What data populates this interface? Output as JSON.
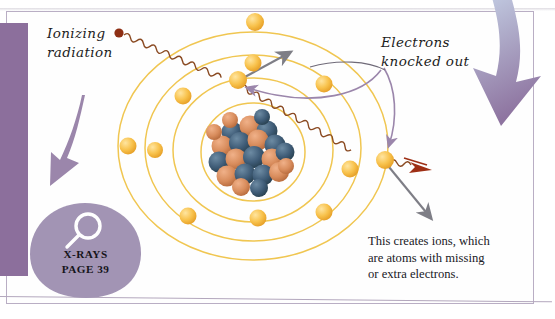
{
  "page": {
    "background_color": "#ffffff",
    "sheet_color": "#fefefe",
    "sheet_border_color": "#b9aec4"
  },
  "labels": {
    "ionizing_radiation": "Ionizing\nradiation",
    "electrons_knocked_out": "Electrons\nknocked out",
    "caption": "This creates ions, which\nare atoms with missing\nor extra electrons."
  },
  "callout": {
    "icon": "magnifier-icon",
    "title": "X-RAYS",
    "page_ref": "PAGE 39",
    "text": "X-RAYS\nPAGE 39",
    "blob_color": "#a294b4"
  },
  "colors": {
    "purple_block": "#8c6f9c",
    "purple_arrow": "#9b86ab",
    "gradient_arrow_top": "#c3d0e6",
    "gradient_arrow_bottom": "#8e74a0",
    "orbit_ring": "#f0c651",
    "electron_fill": "#f7bf46",
    "electron_edge": "#e09a24",
    "nucleus_blue": "#3d5a73",
    "nucleus_orange": "#d98a5a",
    "wave_line": "#8a4a22",
    "red_arrow": "#9e2f15",
    "gray_arrow": "#7e7e86"
  },
  "diagram": {
    "type": "ionizing-radiation-atom-diagram",
    "nucleus": {
      "cx": 253,
      "cy": 152,
      "r": 37
    },
    "orbits": [
      {
        "name": "orbit-1",
        "rx": 52,
        "ry": 49
      },
      {
        "name": "orbit-2",
        "rx": 80,
        "ry": 72
      },
      {
        "name": "orbit-3",
        "rx": 108,
        "ry": 93
      },
      {
        "name": "orbit-4",
        "rx": 135,
        "ry": 114
      }
    ],
    "electrons": [
      {
        "name": "electron-top-outer",
        "x": 255,
        "y": 22
      },
      {
        "name": "electron-top-inner",
        "x": 253,
        "y": 63
      },
      {
        "name": "electron-upper-left",
        "x": 183,
        "y": 96
      },
      {
        "name": "electron-struck",
        "x": 238,
        "y": 80
      },
      {
        "name": "electron-right-mid",
        "x": 324,
        "y": 84
      },
      {
        "name": "electron-far-left",
        "x": 128,
        "y": 146
      },
      {
        "name": "electron-left-inner",
        "x": 155,
        "y": 150
      },
      {
        "name": "electron-ejected",
        "x": 385,
        "y": 160
      },
      {
        "name": "electron-right-inner",
        "x": 350,
        "y": 169
      },
      {
        "name": "electron-bottom-left",
        "x": 188,
        "y": 216
      },
      {
        "name": "electron-bottom-mid",
        "x": 258,
        "y": 218
      },
      {
        "name": "electron-bottom-right",
        "x": 324,
        "y": 212
      }
    ],
    "rays": [
      {
        "name": "incoming-ray",
        "start_dot": {
          "x": 119,
          "y": 33
        },
        "dot_color": "#8e2f14"
      },
      {
        "name": "outgoing-ray",
        "arrowhead": {
          "x": 423,
          "y": 169
        },
        "color": "#9e2f15"
      }
    ],
    "motion_arrows": [
      {
        "name": "knocked-electron-arrow-up",
        "color": "#7e7e86",
        "from": [
          245,
          78
        ],
        "to": [
          292,
          52
        ]
      },
      {
        "name": "knocked-electron-arrow-down",
        "color": "#7e7e86",
        "from": [
          390,
          167
        ],
        "to": [
          432,
          219
        ]
      },
      {
        "name": "pointer-arrow-left",
        "color": "#9b86ab",
        "to": [
          245,
          88
        ]
      },
      {
        "name": "pointer-arrow-down",
        "color": "#9b86ab",
        "to": [
          389,
          148
        ]
      }
    ],
    "decor_arrows": [
      {
        "name": "left-purple-arrow",
        "direction": "down",
        "color": "#9b86ab"
      },
      {
        "name": "right-gradient-arrow",
        "direction": "down",
        "color_from": "#c3d0e6",
        "color_to": "#8e74a0"
      }
    ]
  }
}
